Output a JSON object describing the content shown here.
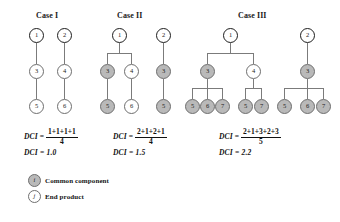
{
  "figure": {
    "cases": [
      {
        "id": "case-1",
        "title": "Case I",
        "title_pos": {
          "x": 36,
          "y": 11
        },
        "nodes": [
          {
            "label": "1",
            "x": 29,
            "y": 28,
            "style": "root"
          },
          {
            "label": "2",
            "x": 57,
            "y": 28,
            "style": "root"
          },
          {
            "label": "3",
            "x": 29,
            "y": 64,
            "style": "white"
          },
          {
            "label": "4",
            "x": 57,
            "y": 64,
            "style": "white"
          },
          {
            "label": "5",
            "x": 29,
            "y": 99,
            "style": "white"
          },
          {
            "label": "6",
            "x": 57,
            "y": 99,
            "style": "white"
          }
        ],
        "edges": [
          {
            "type": "v",
            "x": 36,
            "y": 43,
            "len": 21
          },
          {
            "type": "v",
            "x": 64,
            "y": 43,
            "len": 21
          },
          {
            "type": "v",
            "x": 36,
            "y": 79,
            "len": 20
          },
          {
            "type": "v",
            "x": 64,
            "y": 79,
            "len": 20
          }
        ],
        "formula": {
          "x": 24,
          "y": 128,
          "label": "DCI",
          "numerator": "1+1+1+1",
          "denominator": "4"
        },
        "result": {
          "x": 24,
          "y": 148,
          "text": "DCI = 1.0"
        }
      },
      {
        "id": "case-2",
        "title": "Case II",
        "title_pos": {
          "x": 117,
          "y": 11
        },
        "nodes": [
          {
            "label": "1",
            "x": 112,
            "y": 28,
            "style": "root"
          },
          {
            "label": "2",
            "x": 156,
            "y": 28,
            "style": "root"
          },
          {
            "label": "3",
            "x": 100,
            "y": 64,
            "style": "gray"
          },
          {
            "label": "4",
            "x": 124,
            "y": 64,
            "style": "white"
          },
          {
            "label": "3",
            "x": 156,
            "y": 64,
            "style": "gray"
          },
          {
            "label": "5",
            "x": 100,
            "y": 99,
            "style": "gray"
          },
          {
            "label": "6",
            "x": 124,
            "y": 99,
            "style": "white"
          },
          {
            "label": "5",
            "x": 156,
            "y": 99,
            "style": "gray"
          }
        ],
        "edges": [
          {
            "type": "v",
            "x": 119,
            "y": 43,
            "len": 10
          },
          {
            "type": "h",
            "x": 107,
            "y": 53,
            "len": 25
          },
          {
            "type": "v",
            "x": 107,
            "y": 53,
            "len": 11
          },
          {
            "type": "v",
            "x": 131,
            "y": 53,
            "len": 11
          },
          {
            "type": "v",
            "x": 107,
            "y": 79,
            "len": 20
          },
          {
            "type": "v",
            "x": 131,
            "y": 79,
            "len": 20
          },
          {
            "type": "v",
            "x": 163,
            "y": 43,
            "len": 21
          },
          {
            "type": "v",
            "x": 163,
            "y": 79,
            "len": 20
          }
        ],
        "formula": {
          "x": 113,
          "y": 128,
          "label": "DCI",
          "numerator": "2+1+2+1",
          "denominator": "4"
        },
        "result": {
          "x": 113,
          "y": 148,
          "text": "DCI = 1.5"
        }
      },
      {
        "id": "case-3",
        "title": "Case III",
        "title_pos": {
          "x": 238,
          "y": 11
        },
        "nodes": [
          {
            "label": "1",
            "x": 223,
            "y": 28,
            "style": "root"
          },
          {
            "label": "2",
            "x": 300,
            "y": 28,
            "style": "root"
          },
          {
            "label": "3",
            "x": 200,
            "y": 64,
            "style": "gray"
          },
          {
            "label": "4",
            "x": 246,
            "y": 64,
            "style": "white"
          },
          {
            "label": "3",
            "x": 300,
            "y": 64,
            "style": "gray"
          },
          {
            "label": "5",
            "x": 185,
            "y": 99,
            "style": "gray"
          },
          {
            "label": "6",
            "x": 200,
            "y": 99,
            "style": "gray"
          },
          {
            "label": "7",
            "x": 215,
            "y": 99,
            "style": "gray"
          },
          {
            "label": "5",
            "x": 238,
            "y": 99,
            "style": "gray"
          },
          {
            "label": "7",
            "x": 254,
            "y": 99,
            "style": "gray"
          },
          {
            "label": "5",
            "x": 277,
            "y": 99,
            "style": "gray"
          },
          {
            "label": "6",
            "x": 300,
            "y": 99,
            "style": "gray"
          },
          {
            "label": "7",
            "x": 316,
            "y": 99,
            "style": "gray"
          }
        ],
        "edges": [
          {
            "type": "v",
            "x": 230,
            "y": 43,
            "len": 10
          },
          {
            "type": "h",
            "x": 207,
            "y": 53,
            "len": 47
          },
          {
            "type": "v",
            "x": 207,
            "y": 53,
            "len": 11
          },
          {
            "type": "v",
            "x": 253,
            "y": 53,
            "len": 11
          },
          {
            "type": "v",
            "x": 207,
            "y": 79,
            "len": 9
          },
          {
            "type": "h",
            "x": 192,
            "y": 88,
            "len": 31
          },
          {
            "type": "v",
            "x": 192,
            "y": 88,
            "len": 11
          },
          {
            "type": "v",
            "x": 207,
            "y": 88,
            "len": 11
          },
          {
            "type": "v",
            "x": 222,
            "y": 88,
            "len": 11
          },
          {
            "type": "v",
            "x": 253,
            "y": 79,
            "len": 9
          },
          {
            "type": "h",
            "x": 245,
            "y": 88,
            "len": 16
          },
          {
            "type": "v",
            "x": 245,
            "y": 88,
            "len": 11
          },
          {
            "type": "v",
            "x": 261,
            "y": 88,
            "len": 11
          },
          {
            "type": "v",
            "x": 307,
            "y": 43,
            "len": 21
          },
          {
            "type": "v",
            "x": 307,
            "y": 79,
            "len": 9
          },
          {
            "type": "h",
            "x": 284,
            "y": 88,
            "len": 39
          },
          {
            "type": "v",
            "x": 284,
            "y": 88,
            "len": 11
          },
          {
            "type": "v",
            "x": 307,
            "y": 88,
            "len": 11
          },
          {
            "type": "v",
            "x": 323,
            "y": 88,
            "len": 11
          }
        ],
        "formula": {
          "x": 219,
          "y": 128,
          "label": "DCI",
          "numerator": "2+1+3+2+3",
          "denominator": "5"
        },
        "result": {
          "x": 219,
          "y": 148,
          "text": "DCI = 2.2"
        }
      }
    ],
    "legend": {
      "items": [
        {
          "id": "legend-common-component",
          "symbol": "i",
          "style": "gray",
          "label": "Common component",
          "x": 28,
          "y": 174
        },
        {
          "id": "legend-end-product",
          "symbol": "j",
          "style": "white",
          "label": "End product",
          "x": 28,
          "y": 190
        }
      ]
    },
    "colors": {
      "common_component_fill": "#b9b9b9",
      "end_product_fill": "#ffffff",
      "node_stroke": "#6f6f6f",
      "root_stroke": "#1d1d1d",
      "edge": "#7b7b7b",
      "text": "#111111"
    }
  }
}
